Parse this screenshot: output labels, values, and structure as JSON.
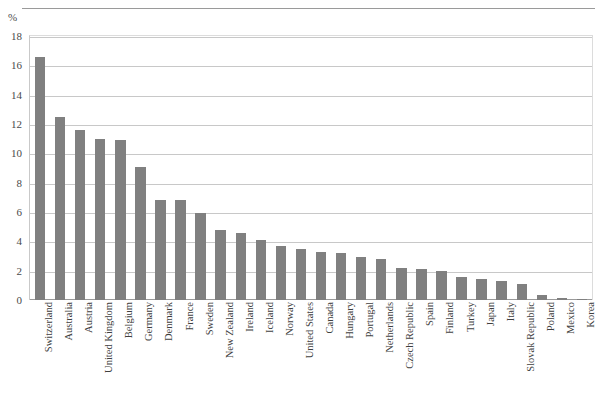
{
  "chart_data": {
    "type": "bar",
    "title": "",
    "subtitle": "",
    "xlabel": "",
    "ylabel": "%",
    "unit_label": "%",
    "ylim": [
      0,
      18
    ],
    "ytick_step": 2,
    "yticks": [
      0,
      2,
      4,
      6,
      8,
      10,
      12,
      14,
      16,
      18
    ],
    "ytick_labels": [
      "0",
      "2",
      "4",
      "6",
      "8",
      "10",
      "12",
      "14",
      "16",
      "18"
    ],
    "grid": true,
    "grid_axis": "y",
    "legend": false,
    "legend_position": "none",
    "orientation": "vertical",
    "bar_color": "#808080",
    "gridline_color": "#c8c8c8",
    "axis_color": "#9a9a9a",
    "categories": [
      "Switzerland",
      "Australia",
      "Austria",
      "United Kingdom",
      "Belgium",
      "Germany",
      "Denmark",
      "France",
      "Sweden",
      "New Zealand",
      "Ireland",
      "Iceland",
      "Norway",
      "United States",
      "Canada",
      "Hungary",
      "Portugal",
      "Netherlands",
      "Czech Republic",
      "Spain",
      "Finland",
      "Turkey",
      "Japan",
      "Italy",
      "Slovak Republic",
      "Poland",
      "Mexico",
      "Korea"
    ],
    "values": [
      16.6,
      12.5,
      11.6,
      11.0,
      10.9,
      9.1,
      6.8,
      6.8,
      5.9,
      4.8,
      4.6,
      4.1,
      3.7,
      3.5,
      3.3,
      3.2,
      2.9,
      2.8,
      2.2,
      2.1,
      2.0,
      1.6,
      1.4,
      1.3,
      1.1,
      0.35,
      0.12,
      0.1
    ]
  }
}
